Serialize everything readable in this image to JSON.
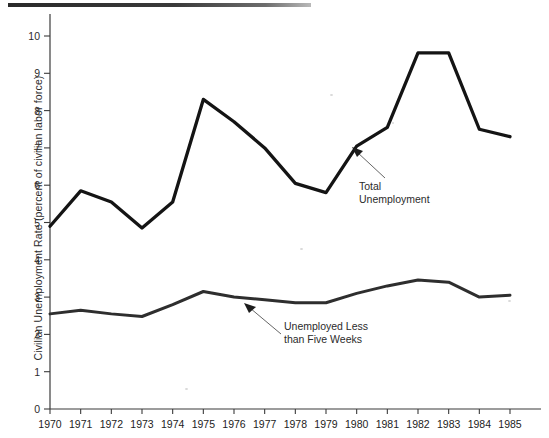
{
  "chart_data": {
    "type": "line",
    "title": "",
    "xlabel": "",
    "ylabel": "Civilian Unemployment Rate (percent of civilian labor force)",
    "xlim": [
      1970,
      1985
    ],
    "ylim": [
      0,
      10.5
    ],
    "grid": false,
    "legend_position": "inline-annotations",
    "x": [
      1970,
      1971,
      1972,
      1973,
      1974,
      1975,
      1976,
      1977,
      1978,
      1979,
      1980,
      1981,
      1982,
      1983,
      1984,
      1985
    ],
    "categories": [
      "1970",
      "1971",
      "1972",
      "1973",
      "1974",
      "1975",
      "1976",
      "1977",
      "1978",
      "1979",
      "1980",
      "1981",
      "1982",
      "1983",
      "1984",
      "1985"
    ],
    "ytick_labels": [
      "0",
      "1",
      "2",
      "3",
      "4",
      "5",
      "6",
      "7",
      "8",
      "9",
      "10"
    ],
    "ytick_values": [
      0,
      1,
      2,
      3,
      4,
      5,
      6,
      7,
      8,
      9,
      10
    ],
    "series": [
      {
        "name": "Total Unemployment",
        "color": "#141414",
        "values": [
          4.9,
          5.85,
          5.55,
          4.85,
          5.55,
          8.3,
          7.7,
          7.0,
          6.05,
          5.8,
          7.05,
          7.55,
          9.55,
          9.55,
          7.5,
          7.3
        ]
      },
      {
        "name": "Unemployed Less than Five Weeks",
        "color": "#2e2e2e",
        "values": [
          2.55,
          2.65,
          2.55,
          2.48,
          2.8,
          3.15,
          3.0,
          2.93,
          2.85,
          2.85,
          3.1,
          3.3,
          3.46,
          3.4,
          3.0,
          3.05
        ]
      }
    ],
    "annotations": [
      {
        "id": "total-unemployment",
        "line1": "Total",
        "line2": "Unemployment",
        "points_to_year": 1980,
        "points_to_value": 6.75
      },
      {
        "id": "unemployed-less-than-five-weeks",
        "line1": "Unemployed Less",
        "line2": "than Five Weeks",
        "points_to_year": 1976,
        "points_to_value": 2.98
      }
    ]
  },
  "axis": {
    "y_axis_title": "Civilian Unemployment Rate (percent of civilian labor force)"
  }
}
